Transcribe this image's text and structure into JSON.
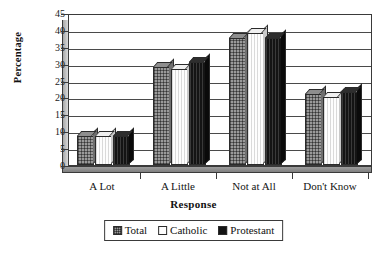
{
  "chart_data": {
    "type": "bar",
    "title": "",
    "xlabel": "Response",
    "ylabel": "Percentage",
    "categories": [
      "A Lot",
      "A Little",
      "Not at All",
      "Don't Know"
    ],
    "series": [
      {
        "name": "Total",
        "values": [
          8.5,
          29.0,
          37.5,
          21.0
        ]
      },
      {
        "name": "Catholic",
        "values": [
          8.5,
          28.5,
          39.0,
          20.0
        ]
      },
      {
        "name": "Protestant",
        "values": [
          8.5,
          30.5,
          37.5,
          21.5
        ]
      }
    ],
    "ylim": [
      0,
      45
    ],
    "yticks": [
      "0",
      "5",
      "10",
      "15",
      "20",
      "25",
      "30",
      "35",
      "40",
      "45"
    ],
    "grid": true,
    "legend_position": "bottom",
    "style": "3d-grouped-bars",
    "colors": {
      "total": "#9a9a9a",
      "catholic": "#fdfdfd",
      "protestant": "#141414",
      "axis": "#3a3a3a",
      "grid": "#4a4a4a",
      "text": "#141414"
    }
  },
  "legend": {
    "items": [
      {
        "label": "Total"
      },
      {
        "label": "Catholic"
      },
      {
        "label": "Protestant"
      }
    ]
  }
}
